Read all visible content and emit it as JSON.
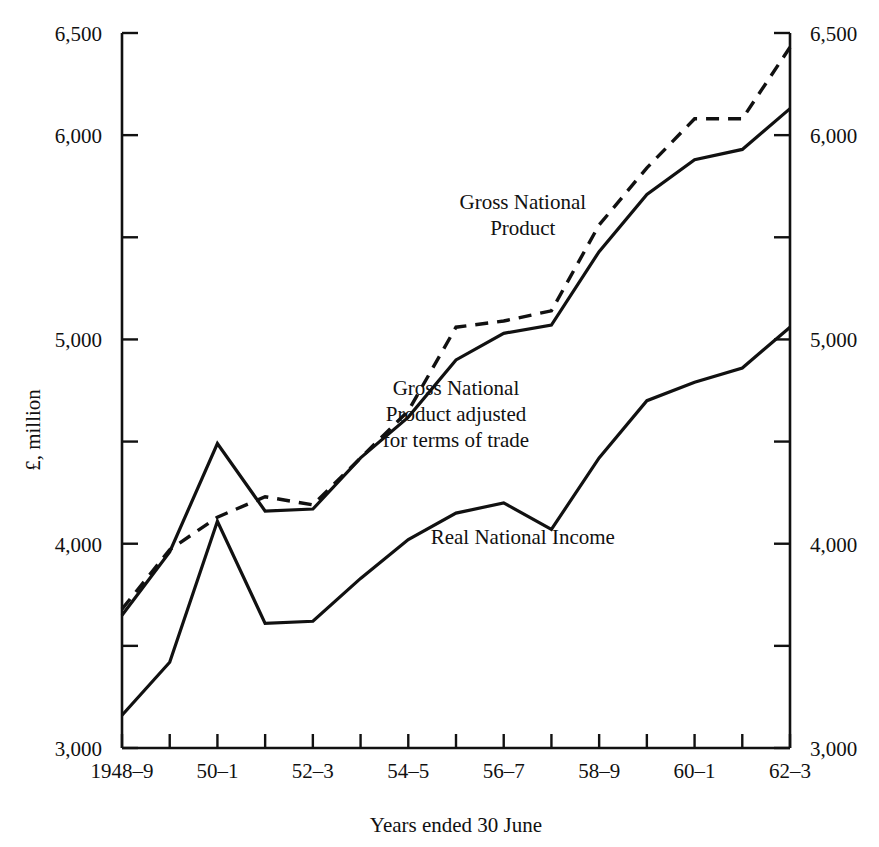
{
  "chart_data": {
    "type": "line",
    "title": "",
    "xlabel": "Years ended 30 June",
    "ylabel": "£, million",
    "ylim": [
      3000,
      6500
    ],
    "ytick_values": [
      3000,
      3500,
      4000,
      4500,
      5000,
      5500,
      6000,
      6500
    ],
    "ytick_labels_left": [
      "3,000",
      "",
      "4,000",
      "",
      "5,000",
      "",
      "6,000",
      "6,500"
    ],
    "ytick_labels_right": [
      "3,000",
      "",
      "4,000",
      "",
      "5,000",
      "",
      "6,000",
      "6,500"
    ],
    "grid": false,
    "legend_position": "inline-annotations",
    "x": [
      "1948-9",
      "49-50",
      "50-1",
      "51-2",
      "52-3",
      "53-4",
      "54-5",
      "55-6",
      "56-7",
      "57-8",
      "58-9",
      "59-60",
      "60-1",
      "61-2",
      "62-3"
    ],
    "xtick_labels": [
      "1948–9",
      "",
      "50–1",
      "",
      "52–3",
      "",
      "54–5",
      "",
      "56–7",
      "",
      "58–9",
      "",
      "60–1",
      "",
      "62–3"
    ],
    "series": [
      {
        "name": "Gross National Product",
        "style": "dashed",
        "values": [
          3680,
          3970,
          4130,
          4230,
          4190,
          4420,
          4650,
          5060,
          5090,
          5140,
          5560,
          5840,
          6080,
          6080,
          6430
        ]
      },
      {
        "name": "Gross National Product adjusted for terms of trade",
        "style": "solid",
        "values": [
          3650,
          3960,
          4490,
          4160,
          4170,
          4420,
          4620,
          4900,
          5030,
          5070,
          5430,
          5710,
          5880,
          5930,
          6130
        ]
      },
      {
        "name": "Real National Income",
        "style": "solid",
        "values": [
          3160,
          3420,
          4110,
          3610,
          3620,
          3830,
          4020,
          4150,
          4200,
          4070,
          4420,
          4700,
          4790,
          4860,
          5060
        ]
      }
    ],
    "annotations": [
      {
        "text_lines": [
          "Gross National",
          "Product"
        ],
        "x": 0.6,
        "y": 5640
      },
      {
        "text_lines": [
          "Gross National",
          "Product adjusted",
          "for terms of trade"
        ],
        "x": 0.5,
        "y": 4730
      },
      {
        "text_lines": [
          "Real National Income"
        ],
        "x": 0.6,
        "y": 4000
      }
    ]
  }
}
